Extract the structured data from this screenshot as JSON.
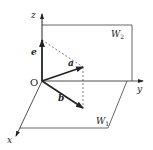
{
  "diagram": {
    "type": "3d-coordinate-vector-diagram",
    "origin_label": "O",
    "axes": {
      "x": "x",
      "y": "y",
      "z": "z"
    },
    "planes": [
      {
        "name": "W",
        "subscript": "1"
      },
      {
        "name": "W",
        "subscript": "2"
      }
    ],
    "vectors": [
      {
        "label": "e"
      },
      {
        "label": "a"
      },
      {
        "label": "b"
      }
    ],
    "colors": {
      "line": "#222222",
      "plane": "#555555",
      "dashed": "#444444",
      "background": "#ffffff"
    }
  }
}
